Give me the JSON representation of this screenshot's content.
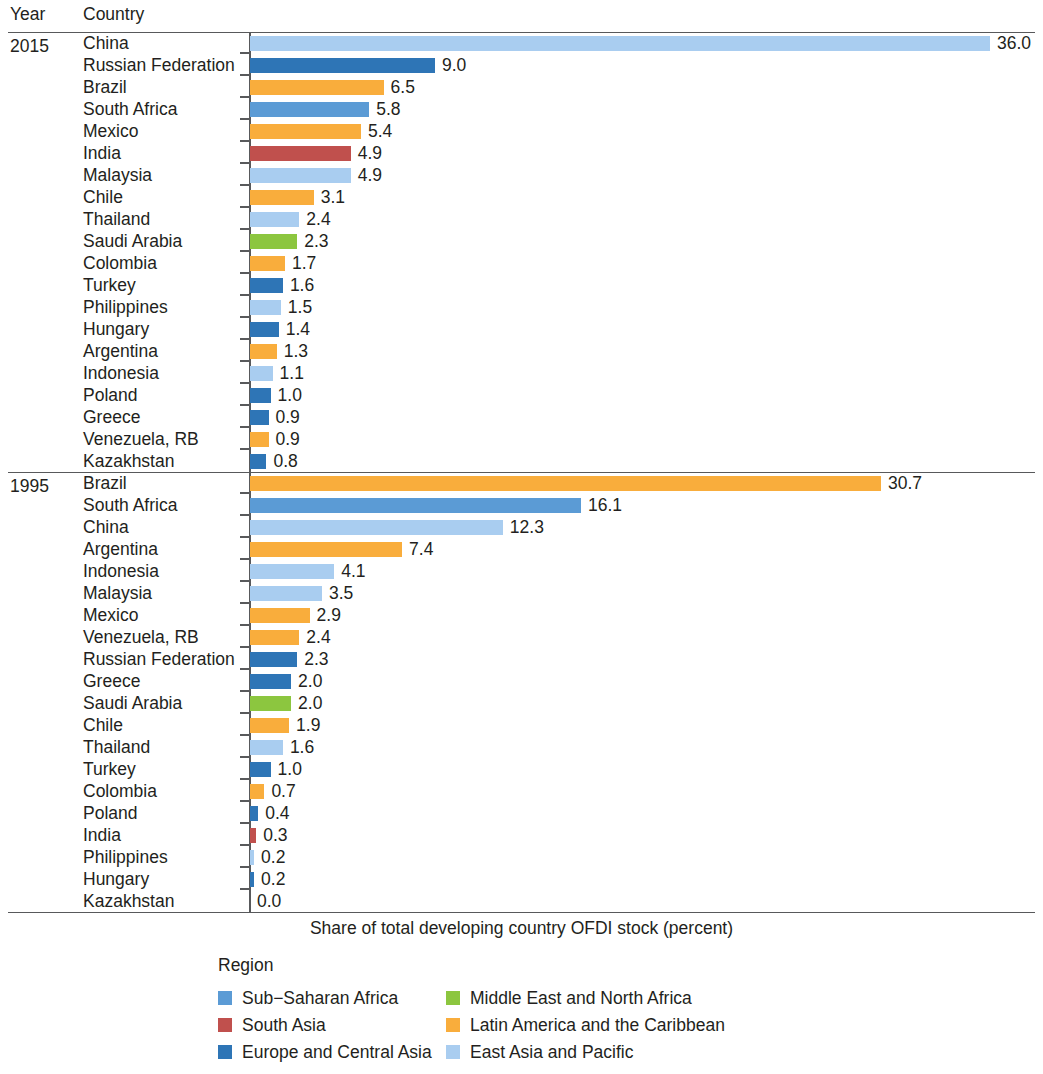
{
  "headers": {
    "year": "Year",
    "country": "Country"
  },
  "axis_caption": "Share of total developing country OFDI stock (percent)",
  "legend": {
    "title": "Region",
    "items": [
      {
        "label": "Sub−Saharan Africa",
        "color": "#5b9bd5"
      },
      {
        "label": "Middle East and North Africa",
        "color": "#8cc63f"
      },
      {
        "label": "South Asia",
        "color": "#c0504d"
      },
      {
        "label": "Latin America and the Caribbean",
        "color": "#f9ad3c"
      },
      {
        "label": "Europe and Central Asia",
        "color": "#2e75b6"
      },
      {
        "label": "East Asia and Pacific",
        "color": "#a9cdf0"
      }
    ]
  },
  "colors": {
    "sub_saharan_africa": "#5b9bd5",
    "middle_east_north_africa": "#8cc63f",
    "south_asia": "#c0504d",
    "latin_america_caribbean": "#f9ad3c",
    "europe_central_asia": "#2e75b6",
    "east_asia_pacific": "#a9cdf0"
  },
  "chart_data": {
    "type": "bar",
    "title": "",
    "xlabel": "Share of total developing country OFDI stock (percent)",
    "ylabel": "",
    "orientation": "horizontal",
    "xlim": [
      0,
      36
    ],
    "grid": false,
    "legend_position": "bottom",
    "value_label_format": "one decimal",
    "groups": [
      {
        "year": "2015",
        "rows": [
          {
            "country": "China",
            "value": 36.0,
            "label": "36.0",
            "region": "East Asia and Pacific",
            "color": "#a9cdf0"
          },
          {
            "country": "Russian Federation",
            "value": 9.0,
            "label": "9.0",
            "region": "Europe and Central Asia",
            "color": "#2e75b6"
          },
          {
            "country": "Brazil",
            "value": 6.5,
            "label": "6.5",
            "region": "Latin America and the Caribbean",
            "color": "#f9ad3c"
          },
          {
            "country": "South Africa",
            "value": 5.8,
            "label": "5.8",
            "region": "Sub−Saharan Africa",
            "color": "#5b9bd5"
          },
          {
            "country": "Mexico",
            "value": 5.4,
            "label": "5.4",
            "region": "Latin America and the Caribbean",
            "color": "#f9ad3c"
          },
          {
            "country": "India",
            "value": 4.9,
            "label": "4.9",
            "region": "South Asia",
            "color": "#c0504d"
          },
          {
            "country": "Malaysia",
            "value": 4.9,
            "label": "4.9",
            "region": "East Asia and Pacific",
            "color": "#a9cdf0"
          },
          {
            "country": "Chile",
            "value": 3.1,
            "label": "3.1",
            "region": "Latin America and the Caribbean",
            "color": "#f9ad3c"
          },
          {
            "country": "Thailand",
            "value": 2.4,
            "label": "2.4",
            "region": "East Asia and Pacific",
            "color": "#a9cdf0"
          },
          {
            "country": "Saudi Arabia",
            "value": 2.3,
            "label": "2.3",
            "region": "Middle East and North Africa",
            "color": "#8cc63f"
          },
          {
            "country": "Colombia",
            "value": 1.7,
            "label": "1.7",
            "region": "Latin America and the Caribbean",
            "color": "#f9ad3c"
          },
          {
            "country": "Turkey",
            "value": 1.6,
            "label": "1.6",
            "region": "Europe and Central Asia",
            "color": "#2e75b6"
          },
          {
            "country": "Philippines",
            "value": 1.5,
            "label": "1.5",
            "region": "East Asia and Pacific",
            "color": "#a9cdf0"
          },
          {
            "country": "Hungary",
            "value": 1.4,
            "label": "1.4",
            "region": "Europe and Central Asia",
            "color": "#2e75b6"
          },
          {
            "country": "Argentina",
            "value": 1.3,
            "label": "1.3",
            "region": "Latin America and the Caribbean",
            "color": "#f9ad3c"
          },
          {
            "country": "Indonesia",
            "value": 1.1,
            "label": "1.1",
            "region": "East Asia and Pacific",
            "color": "#a9cdf0"
          },
          {
            "country": "Poland",
            "value": 1.0,
            "label": "1.0",
            "region": "Europe and Central Asia",
            "color": "#2e75b6"
          },
          {
            "country": "Greece",
            "value": 0.9,
            "label": "0.9",
            "region": "Europe and Central Asia",
            "color": "#2e75b6"
          },
          {
            "country": "Venezuela, RB",
            "value": 0.9,
            "label": "0.9",
            "region": "Latin America and the Caribbean",
            "color": "#f9ad3c"
          },
          {
            "country": "Kazakhstan",
            "value": 0.8,
            "label": "0.8",
            "region": "Europe and Central Asia",
            "color": "#2e75b6"
          }
        ]
      },
      {
        "year": "1995",
        "rows": [
          {
            "country": "Brazil",
            "value": 30.7,
            "label": "30.7",
            "region": "Latin America and the Caribbean",
            "color": "#f9ad3c"
          },
          {
            "country": "South Africa",
            "value": 16.1,
            "label": "16.1",
            "region": "Sub−Saharan Africa",
            "color": "#5b9bd5"
          },
          {
            "country": "China",
            "value": 12.3,
            "label": "12.3",
            "region": "East Asia and Pacific",
            "color": "#a9cdf0"
          },
          {
            "country": "Argentina",
            "value": 7.4,
            "label": "7.4",
            "region": "Latin America and the Caribbean",
            "color": "#f9ad3c"
          },
          {
            "country": "Indonesia",
            "value": 4.1,
            "label": "4.1",
            "region": "East Asia and Pacific",
            "color": "#a9cdf0"
          },
          {
            "country": "Malaysia",
            "value": 3.5,
            "label": "3.5",
            "region": "East Asia and Pacific",
            "color": "#a9cdf0"
          },
          {
            "country": "Mexico",
            "value": 2.9,
            "label": "2.9",
            "region": "Latin America and the Caribbean",
            "color": "#f9ad3c"
          },
          {
            "country": "Venezuela, RB",
            "value": 2.4,
            "label": "2.4",
            "region": "Latin America and the Caribbean",
            "color": "#f9ad3c"
          },
          {
            "country": "Russian Federation",
            "value": 2.3,
            "label": "2.3",
            "region": "Europe and Central Asia",
            "color": "#2e75b6"
          },
          {
            "country": "Greece",
            "value": 2.0,
            "label": "2.0",
            "region": "Europe and Central Asia",
            "color": "#2e75b6"
          },
          {
            "country": "Saudi Arabia",
            "value": 2.0,
            "label": "2.0",
            "region": "Middle East and North Africa",
            "color": "#8cc63f"
          },
          {
            "country": "Chile",
            "value": 1.9,
            "label": "1.9",
            "region": "Latin America and the Caribbean",
            "color": "#f9ad3c"
          },
          {
            "country": "Thailand",
            "value": 1.6,
            "label": "1.6",
            "region": "East Asia and Pacific",
            "color": "#a9cdf0"
          },
          {
            "country": "Turkey",
            "value": 1.0,
            "label": "1.0",
            "region": "Europe and Central Asia",
            "color": "#2e75b6"
          },
          {
            "country": "Colombia",
            "value": 0.7,
            "label": "0.7",
            "region": "Latin America and the Caribbean",
            "color": "#f9ad3c"
          },
          {
            "country": "Poland",
            "value": 0.4,
            "label": "0.4",
            "region": "Europe and Central Asia",
            "color": "#2e75b6"
          },
          {
            "country": "India",
            "value": 0.3,
            "label": "0.3",
            "region": "South Asia",
            "color": "#c0504d"
          },
          {
            "country": "Philippines",
            "value": 0.2,
            "label": "0.2",
            "region": "East Asia and Pacific",
            "color": "#a9cdf0"
          },
          {
            "country": "Hungary",
            "value": 0.2,
            "label": "0.2",
            "region": "Europe and Central Asia",
            "color": "#2e75b6"
          },
          {
            "country": "Kazakhstan",
            "value": 0.0,
            "label": "0.0",
            "region": "East Asia and Pacific",
            "color": "#a9cdf0"
          }
        ]
      }
    ]
  }
}
